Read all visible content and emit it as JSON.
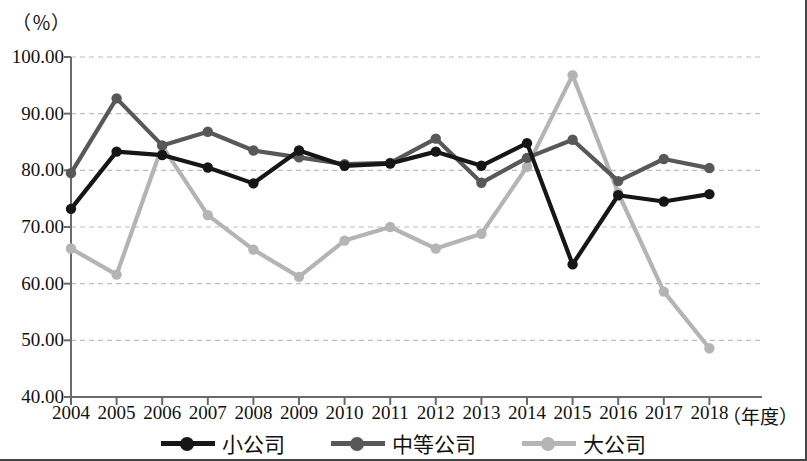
{
  "chart_data": {
    "type": "line",
    "title": "",
    "subtitle": "",
    "xlabel": "（年度）",
    "ylabel": "（％）",
    "ylim": [
      40.0,
      100.0
    ],
    "ytick_labels": [
      "100.00",
      "90.00",
      "80.00",
      "70.00",
      "60.00",
      "50.00",
      "40.00"
    ],
    "ytick_values": [
      100.0,
      90.0,
      80.0,
      70.0,
      60.0,
      50.0,
      40.0
    ],
    "grid": "horizontal-dashed",
    "legend_position": "bottom-center",
    "categories": [
      "2004",
      "2005",
      "2006",
      "2007",
      "2008",
      "2009",
      "2010",
      "2011",
      "2012",
      "2013",
      "2014",
      "2015",
      "2016",
      "2017",
      "2018"
    ],
    "x": [
      2004,
      2005,
      2006,
      2007,
      2008,
      2009,
      2010,
      2011,
      2012,
      2013,
      2014,
      2015,
      2016,
      2017,
      2018
    ],
    "series": [
      {
        "name": "小公司",
        "color": "#161616",
        "values": [
          73.2,
          83.3,
          82.7,
          80.5,
          77.7,
          83.5,
          80.8,
          81.2,
          83.3,
          80.8,
          84.8,
          63.4,
          75.6,
          74.5,
          75.8
        ]
      },
      {
        "name": "中等公司",
        "color": "#585858",
        "values": [
          79.5,
          92.7,
          84.4,
          86.8,
          83.5,
          82.3,
          81.1,
          81.3,
          85.6,
          77.8,
          82.2,
          85.4,
          78.1,
          82.0,
          80.4
        ]
      },
      {
        "name": "大公司",
        "color": "#b4b4b4",
        "values": [
          66.2,
          61.6,
          84.3,
          72.1,
          66.0,
          61.2,
          67.6,
          70.0,
          66.2,
          68.8,
          80.6,
          96.8,
          76.0,
          58.6,
          48.6
        ]
      }
    ]
  },
  "legend": {
    "items": [
      {
        "label": "小公司",
        "color": "#161616",
        "mark": "line-with-dot"
      },
      {
        "label": "中等公司",
        "color": "#585858",
        "mark": "line-with-dot"
      },
      {
        "label": "大公司",
        "color": "#b4b4b4",
        "mark": "line-with-dot"
      }
    ]
  },
  "axes": {
    "y_unit": "（％）",
    "x_unit": "（年度）",
    "axis_color": "#6a6a6a",
    "grid_color": "#bdbdbd"
  }
}
